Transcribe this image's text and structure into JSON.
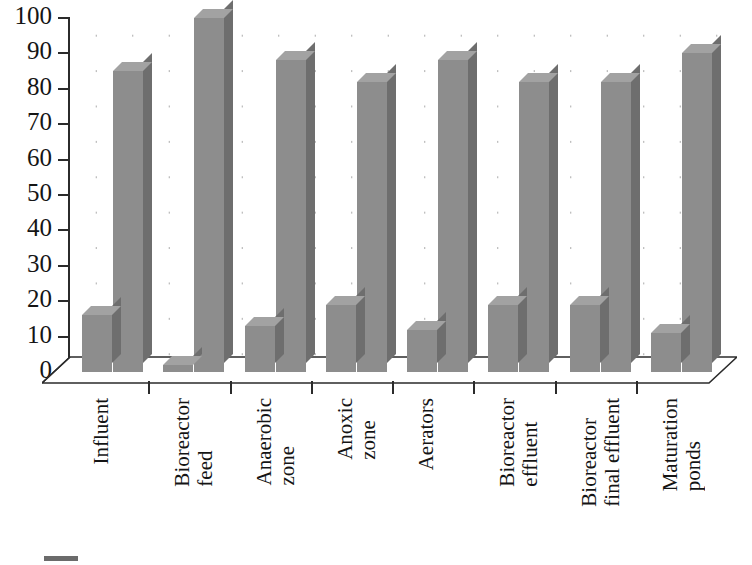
{
  "chart_data": {
    "type": "bar",
    "title": "",
    "xlabel": "",
    "ylabel": "",
    "ylim": [
      0,
      100
    ],
    "ytick_values": [
      0,
      10,
      20,
      30,
      40,
      50,
      60,
      70,
      80,
      90,
      100
    ],
    "ytick_labels": [
      "0",
      "10",
      "20",
      "30",
      "40",
      "50",
      "60",
      "70",
      "80",
      "90",
      "100"
    ],
    "grid": "dotted",
    "legend_position": "bottom-left",
    "style": "3d-column",
    "categories": [
      "Influent",
      "Bioreactor feed",
      "Anaerobic zone",
      "Anoxic zone",
      "Aerators",
      "Bioreactor effluent",
      "Bioreactor final effluent",
      "Maturation ponds"
    ],
    "category_lines": [
      [
        "Influent"
      ],
      [
        "Bioreactor",
        "feed"
      ],
      [
        "Anaerobic",
        "zone"
      ],
      [
        "Anoxic",
        "zone"
      ],
      [
        "Aerators"
      ],
      [
        "Bioreactor",
        "effluent"
      ],
      [
        "Bioreactor",
        "final effluent"
      ],
      [
        "Maturation",
        "ponds"
      ]
    ],
    "series": [
      {
        "name": "series-1",
        "color": "#8d8d8d",
        "values": [
          16,
          2,
          13,
          19,
          12,
          19,
          19,
          11
        ]
      },
      {
        "name": "series-2",
        "color": "#8d8d8d",
        "values": [
          85,
          100,
          88,
          82,
          88,
          82,
          82,
          90
        ]
      }
    ]
  },
  "legend": {
    "items": [
      {
        "label": "",
        "color": "#6b6b6b"
      }
    ]
  },
  "colors": {
    "bar_face": "#8d8d8d",
    "bar_side": "#6e6e6e",
    "bar_top": "#a2a2a2",
    "axis": "#2b2b2b",
    "grid_dot": "#9a9a9a",
    "text": "#141414",
    "background": "#ffffff"
  }
}
